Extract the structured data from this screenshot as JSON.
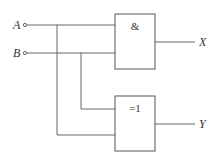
{
  "diagram": {
    "type": "logic-circuit",
    "inputs": [
      {
        "label": "A"
      },
      {
        "label": "B"
      }
    ],
    "gates": [
      {
        "id": "and-gate",
        "symbol": "&"
      },
      {
        "id": "xor-gate",
        "symbol": "=1"
      }
    ],
    "outputs": [
      {
        "label": "X"
      },
      {
        "label": "Y"
      }
    ],
    "colors": {
      "line": "#666666",
      "text": "#333333",
      "background": "#ffffff"
    }
  }
}
